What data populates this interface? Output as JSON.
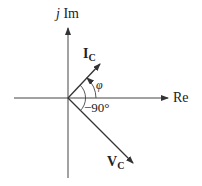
{
  "diagram": {
    "type": "phasor-diagram",
    "axes": {
      "vertical_label_prefix": "j",
      "vertical_label": "Im",
      "horizontal_label": "Re"
    },
    "phasors": [
      {
        "name": "I",
        "subscript": "C",
        "angle_label": "φ",
        "direction": "up-right"
      },
      {
        "name": "V",
        "subscript": "C",
        "angle_label": "−90°",
        "direction": "down-right"
      }
    ],
    "colors": {
      "line": "#333333",
      "text": "#222222",
      "background": "#ffffff"
    }
  }
}
